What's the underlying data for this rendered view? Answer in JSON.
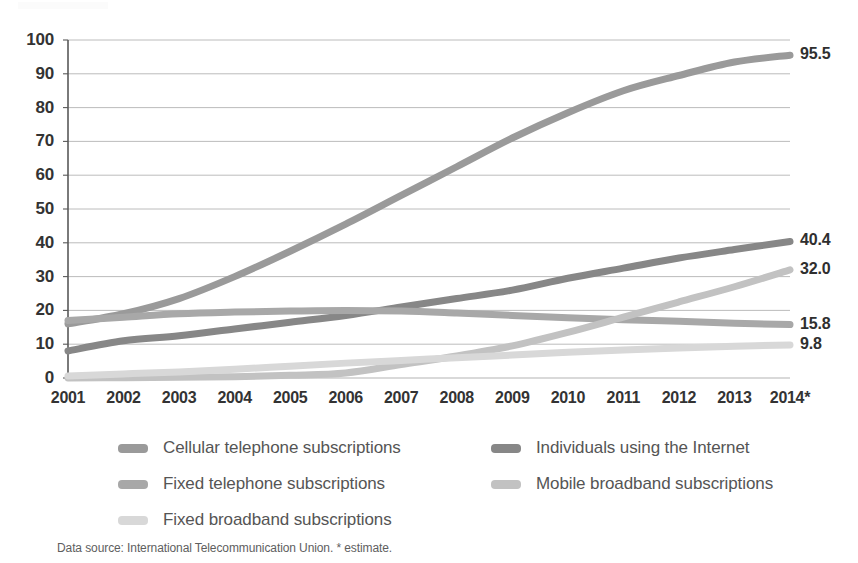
{
  "chart_data": {
    "type": "line",
    "title": "",
    "subtitle": "",
    "xlabel": "",
    "ylabel": "",
    "xlim": [
      2001,
      2014
    ],
    "ylim": [
      0,
      100
    ],
    "grid": true,
    "legend_position": "bottom",
    "categories": [
      "2001",
      "2002",
      "2003",
      "2004",
      "2005",
      "2006",
      "2007",
      "2008",
      "2009",
      "2010",
      "2011",
      "2012",
      "2013",
      "2014*"
    ],
    "ytick_labels": [
      "100",
      "90",
      "80",
      "70",
      "60",
      "50",
      "40",
      "30",
      "20",
      "10",
      "0"
    ],
    "ytick_values": [
      100,
      90,
      80,
      70,
      60,
      50,
      40,
      30,
      20,
      10,
      0
    ],
    "series": [
      {
        "name": "Cellular telephone subscriptions",
        "color": "#9a9a9a",
        "end_label": "95.5",
        "values": [
          16.0,
          19.0,
          23.5,
          30.0,
          37.5,
          45.5,
          54.0,
          62.5,
          71.0,
          78.5,
          85.0,
          89.5,
          93.5,
          95.5
        ]
      },
      {
        "name": "Individuals using the Internet",
        "color": "#878787",
        "end_label": "40.4",
        "values": [
          8.0,
          11.0,
          12.5,
          14.5,
          16.5,
          18.5,
          21.0,
          23.5,
          26.0,
          29.5,
          32.5,
          35.5,
          38.0,
          40.4
        ]
      },
      {
        "name": "Fixed telephone subscriptions",
        "color": "#a8a8a8",
        "end_label": "15.8",
        "values": [
          17.0,
          18.0,
          19.0,
          19.5,
          19.8,
          20.0,
          19.8,
          19.2,
          18.5,
          17.8,
          17.2,
          16.8,
          16.2,
          15.8
        ]
      },
      {
        "name": "Mobile broadband subscriptions",
        "color": "#c2c2c2",
        "end_label": "32.0",
        "values": [
          0.0,
          0.1,
          0.2,
          0.4,
          0.8,
          1.5,
          4.0,
          6.5,
          9.5,
          13.5,
          18.0,
          22.5,
          27.0,
          32.0
        ]
      },
      {
        "name": "Fixed broadband subscriptions",
        "color": "#d8d8d8",
        "end_label": "9.8",
        "values": [
          0.6,
          1.2,
          1.8,
          2.6,
          3.5,
          4.4,
          5.2,
          6.0,
          6.8,
          7.6,
          8.3,
          8.9,
          9.4,
          9.8
        ]
      }
    ]
  },
  "legend": {
    "items": [
      {
        "label": "Cellular telephone subscriptions",
        "color": "#9a9a9a"
      },
      {
        "label": "Individuals using the Internet",
        "color": "#878787"
      },
      {
        "label": "Fixed telephone subscriptions",
        "color": "#a8a8a8"
      },
      {
        "label": "Mobile broadband subscriptions",
        "color": "#c2c2c2"
      },
      {
        "label": "Fixed broadband subscriptions",
        "color": "#d8d8d8"
      }
    ]
  },
  "footnote": {
    "text": "Data source: International Telecommunication Union. * estimate."
  },
  "colors": {
    "axis": "#595959",
    "grid": "#b4b4b4",
    "tick_text": "#333333",
    "legend_text": "#555555",
    "footnote_text": "#5e5e5e",
    "background": "#ffffff"
  }
}
